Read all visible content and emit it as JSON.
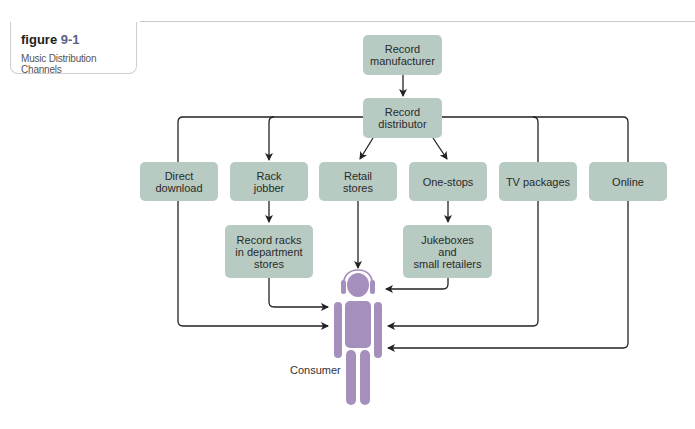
{
  "figure": {
    "label": "figure",
    "number": "9-1",
    "title": "Music Distribution Channels"
  },
  "nodes": {
    "manufacturer": "Record\nmanufacturer",
    "distributor": "Record\ndistributor",
    "direct_download": "Direct\ndownload",
    "rack_jobber": "Rack\njobber",
    "retail_stores": "Retail\nstores",
    "one_stops": "One-stops",
    "tv_packages": "TV packages",
    "online": "Online",
    "record_racks": "Record racks\nin department\nstores",
    "jukeboxes": "Jukeboxes\nand\nsmall retailers",
    "consumer": "Consumer"
  },
  "edges": [
    [
      "Record manufacturer",
      "Record distributor"
    ],
    [
      "Record distributor",
      "Direct download"
    ],
    [
      "Record distributor",
      "Rack jobber"
    ],
    [
      "Record distributor",
      "Retail stores"
    ],
    [
      "Record distributor",
      "One-stops"
    ],
    [
      "Record distributor",
      "TV packages"
    ],
    [
      "Record distributor",
      "Online"
    ],
    [
      "Rack jobber",
      "Record racks in department stores"
    ],
    [
      "One-stops",
      "Jukeboxes and small retailers"
    ],
    [
      "Record racks in department stores",
      "Consumer"
    ],
    [
      "Direct download",
      "Consumer"
    ],
    [
      "Retail stores",
      "Consumer"
    ],
    [
      "Jukeboxes and small retailers",
      "Consumer"
    ],
    [
      "TV packages",
      "Consumer"
    ],
    [
      "Online",
      "Consumer"
    ]
  ],
  "colors": {
    "box_fill": "#b7cbc3",
    "consumer_fill": "#a58fbd",
    "figure_number": "#5a5f86",
    "line": "#222222"
  }
}
